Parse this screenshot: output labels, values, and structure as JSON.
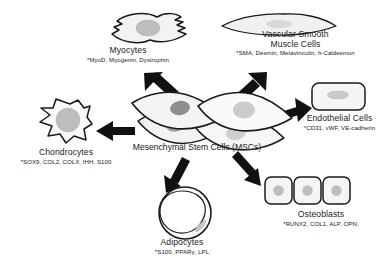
{
  "figure": {
    "center": {
      "name": "msc-cluster",
      "title": "Mesenchymal Stem Cells (MSCs)"
    },
    "lineages": [
      {
        "key": "myocytes",
        "title": "Myocytes",
        "markers": "*MyoD, Myogenin, Dystrophin",
        "icon": "myocyte-cell-icon"
      },
      {
        "key": "vascular_smooth_muscle_cells",
        "title_line1": "Vascular Smooth",
        "title_line2": "Muscle Cells",
        "markers": "*SMA, Desmin, Metavinculin, h-Caldesmon",
        "icon": "smooth-muscle-cell-icon"
      },
      {
        "key": "endothelial_cells",
        "title": "Endothelial Cells",
        "markers": "*CD31, vWF, VE-cadherin",
        "icon": "endothelial-cell-icon"
      },
      {
        "key": "chondrocytes",
        "title": "Chondrocytes",
        "markers": "*SOX9, COL2, COLX, IHH, S100",
        "icon": "chondrocyte-cell-icon"
      },
      {
        "key": "adipocytes",
        "title": "Adipocytes",
        "markers": "*S100, PPARγ, LPL",
        "icon": "adipocyte-cell-icon"
      },
      {
        "key": "osteoblasts",
        "title": "Osteoblasts",
        "markers": "*RUNX2, COL1, ALP, OPN,",
        "icon": "osteoblast-cell-icon"
      }
    ],
    "arrows": [
      {
        "name": "arrow-to-myocytes",
        "direction": "up-left"
      },
      {
        "name": "arrow-to-vascular-smooth-muscle",
        "direction": "up-right"
      },
      {
        "name": "arrow-to-endothelial",
        "direction": "right"
      },
      {
        "name": "arrow-to-chondrocytes",
        "direction": "left"
      },
      {
        "name": "arrow-to-adipocytes",
        "direction": "down-left"
      },
      {
        "name": "arrow-to-osteoblasts",
        "direction": "down-right"
      }
    ],
    "colors": {
      "background": "#ffffff",
      "outline": "#1a1a1a",
      "cell_fill": "#f5f5f5",
      "nucleus_fill": "#bdbdbd",
      "arrow": "#111111",
      "text": "#1b1b1b"
    }
  }
}
